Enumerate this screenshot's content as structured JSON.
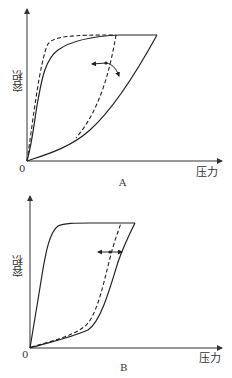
{
  "panels": [
    {
      "id": "A",
      "caption": "A",
      "origin_label": "0",
      "xlabel": "压力",
      "ylabel": "容积",
      "curves": [
        {
          "name": "solid-loop",
          "style": "solid"
        },
        {
          "name": "dashed-loop",
          "style": "dashed"
        }
      ],
      "annotation": "curved-double-arrow"
    },
    {
      "id": "B",
      "caption": "B",
      "origin_label": "0",
      "xlabel": "压力",
      "ylabel": "容积",
      "curves": [
        {
          "name": "solid-loop",
          "style": "solid"
        },
        {
          "name": "dashed-loop",
          "style": "dashed"
        }
      ],
      "annotation": "horizontal-double-arrow"
    }
  ],
  "colors": {
    "line": "#2a2a2a",
    "axis": "#333333",
    "background": "#ffffff"
  }
}
